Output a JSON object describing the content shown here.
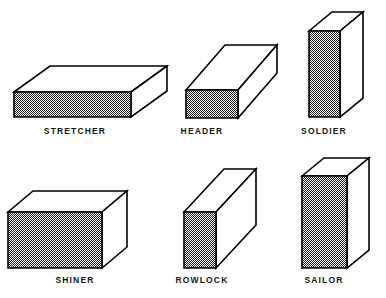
{
  "figure": {
    "background_color": "#ffffff",
    "line_color": "#000000",
    "shade_color": "#8a8a8a",
    "face_color": "#ffffff",
    "label_color": "#141414"
  },
  "bricks": [
    {
      "id": "stretcher",
      "label": "STRETCHER",
      "row": 0,
      "column": 0,
      "description": "Brick laid flat with its long narrow face exposed",
      "cell": {
        "left": 0,
        "top": 0,
        "width": 150,
        "height": 149
      },
      "label_top": 126,
      "geometry": {
        "front": "14,92 14,117 131,117 131,92",
        "top": "14,92 50,66 167,66 131,92",
        "side": "131,92 167,66 167,91 131,117"
      }
    },
    {
      "id": "header",
      "label": "HEADER",
      "row": 0,
      "column": 1,
      "description": "Brick laid flat with its short end face exposed",
      "cell": {
        "left": 140,
        "top": 0,
        "width": 124,
        "height": 149
      },
      "label_top": 126,
      "geometry": {
        "front": "46,90 46,118 98,118 98,90",
        "top": "46,90 85,45 137,45 98,90",
        "side": "98,90 137,45 137,73 98,118"
      }
    },
    {
      "id": "soldier",
      "label": "SOLDIER",
      "row": 0,
      "column": 2,
      "description": "Brick standing upright on end with the narrow face out",
      "cell": {
        "left": 262,
        "top": 0,
        "width": 124,
        "height": 149
      },
      "label_top": 126,
      "geometry": {
        "front": "47,31 47,117 78,117 78,31",
        "top": "47,31 70,12 101,12 78,31",
        "side": "78,31 101,12 101,98 78,117"
      }
    },
    {
      "id": "shiner",
      "label": "SHINER",
      "row": 1,
      "column": 0,
      "description": "Brick laid flat with the broad face exposed",
      "cell": {
        "left": 0,
        "top": 149,
        "width": 150,
        "height": 149
      },
      "label_top": 126,
      "geometry": {
        "front": "8,63 8,119 102,119 102,63",
        "top": "8,63 33,42 127,42 102,63",
        "side": "102,63 127,42 127,98 102,119"
      }
    },
    {
      "id": "rowlock",
      "label": "ROWLOCK",
      "row": 1,
      "column": 1,
      "description": "Brick laid on edge with the short end face exposed",
      "cell": {
        "left": 140,
        "top": 149,
        "width": 124,
        "height": 149
      },
      "label_top": 126,
      "geometry": {
        "front": "44,63 44,119 76,119 76,63",
        "top": "44,63 84,20 116,20 76,63",
        "side": "76,63 116,20 116,76 76,119"
      }
    },
    {
      "id": "sailor",
      "label": "SAILOR",
      "row": 1,
      "column": 2,
      "description": "Brick standing upright on end with the broad face out",
      "cell": {
        "left": 262,
        "top": 149,
        "width": 124,
        "height": 149
      },
      "label_top": 126,
      "geometry": {
        "front": "40,27 40,119 85,119 85,27",
        "top": "40,27 62,9 107,9 85,27",
        "side": "85,27 107,9 107,101 85,119"
      }
    }
  ]
}
